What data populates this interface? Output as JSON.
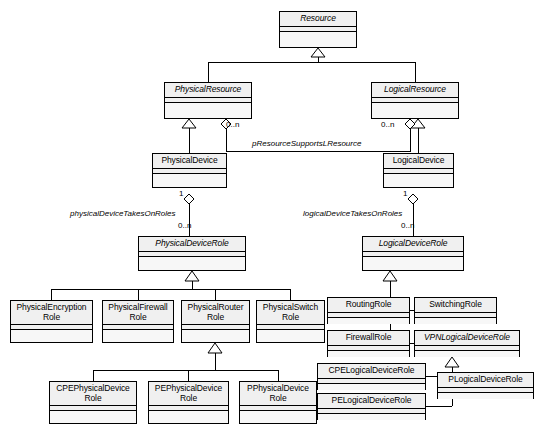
{
  "diagram": {
    "kind": "uml-class-diagram",
    "background": "#ffffff",
    "line_color": "#000000",
    "class_header_fill": "#f0f0f0",
    "class_body_fill": "#f7f7f7"
  },
  "classes": [
    {
      "id": "resource",
      "name": "Resource",
      "abstract": true,
      "x": 279,
      "y": 11,
      "w": 78,
      "h": 37
    },
    {
      "id": "physical_resource",
      "name": "PhysicalResource",
      "abstract": true,
      "x": 164,
      "y": 82,
      "w": 88,
      "h": 37
    },
    {
      "id": "logical_resource",
      "name": "LogicalResource",
      "abstract": true,
      "x": 371,
      "y": 82,
      "w": 88,
      "h": 37
    },
    {
      "id": "physical_device",
      "name": "PhysicalDevice",
      "abstract": false,
      "x": 152,
      "y": 153,
      "w": 75,
      "h": 35
    },
    {
      "id": "logical_device",
      "name": "LogicalDevice",
      "abstract": false,
      "x": 383,
      "y": 153,
      "w": 71,
      "h": 35
    },
    {
      "id": "physical_device_role",
      "name": "PhysicalDeviceRole",
      "abstract": true,
      "x": 138,
      "y": 236,
      "w": 108,
      "h": 35
    },
    {
      "id": "logical_device_role",
      "name": "LogicalDeviceRole",
      "abstract": true,
      "x": 362,
      "y": 236,
      "w": 102,
      "h": 35
    },
    {
      "id": "physical_encryption_role",
      "name": "PhysicalEncryption\nRole",
      "abstract": false,
      "x": 10,
      "y": 300,
      "w": 83,
      "h": 43
    },
    {
      "id": "physical_firewall_role",
      "name": "PhysicalFirewall\nRole",
      "abstract": false,
      "x": 102,
      "y": 300,
      "w": 72,
      "h": 43
    },
    {
      "id": "physical_router_role",
      "name": "PhysicalRouter\nRole",
      "abstract": false,
      "x": 181,
      "y": 300,
      "w": 69,
      "h": 43
    },
    {
      "id": "physical_switch_role",
      "name": "PhysicalSwitch\nRole",
      "abstract": false,
      "x": 256,
      "y": 300,
      "w": 69,
      "h": 43
    },
    {
      "id": "cpe_physical_device_role",
      "name": "CPEPhysicalDevice\nRole",
      "abstract": false,
      "x": 49,
      "y": 381,
      "w": 88,
      "h": 43
    },
    {
      "id": "pe_physical_device_role",
      "name": "PEPhysicalDevice\nRole",
      "abstract": false,
      "x": 148,
      "y": 381,
      "w": 81,
      "h": 43
    },
    {
      "id": "p_physical_device_role",
      "name": "PPhysicalDevice\nRole",
      "abstract": false,
      "x": 239,
      "y": 381,
      "w": 78,
      "h": 43
    },
    {
      "id": "routing_role",
      "name": "RoutingRole",
      "abstract": false,
      "x": 327,
      "y": 297,
      "w": 83,
      "h": 27
    },
    {
      "id": "switching_role",
      "name": "SwitchingRole",
      "abstract": false,
      "x": 414,
      "y": 297,
      "w": 83,
      "h": 27
    },
    {
      "id": "firewall_role",
      "name": "FirewallRole",
      "abstract": false,
      "x": 327,
      "y": 330,
      "w": 83,
      "h": 27
    },
    {
      "id": "vpn_logical_device_role",
      "name": "VPNLogicalDeviceRole",
      "abstract": true,
      "x": 414,
      "y": 330,
      "w": 106,
      "h": 27
    },
    {
      "id": "cpe_logical_device_role",
      "name": "CPELogicalDeviceRole",
      "abstract": false,
      "x": 317,
      "y": 363,
      "w": 109,
      "h": 27
    },
    {
      "id": "p_logical_device_role",
      "name": "PLogicalDeviceRole",
      "abstract": false,
      "x": 437,
      "y": 372,
      "w": 97,
      "h": 27
    },
    {
      "id": "pe_logical_device_role",
      "name": "PELogicalDeviceRole",
      "abstract": false,
      "x": 317,
      "y": 393,
      "w": 109,
      "h": 27
    }
  ],
  "associations": [
    {
      "id": "p_resource_supports_l_resource",
      "label": "pResourceSupportsLResource",
      "label_x": 252,
      "label_y": 139,
      "source": "physical_resource",
      "target": "logical_resource",
      "source_multiplicity": "0..n",
      "source_multiplicity_x": 226,
      "source_multiplicity_y": 120,
      "target_multiplicity": "0..n",
      "target_multiplicity_x": 381,
      "target_multiplicity_y": 120
    },
    {
      "id": "physical_device_takes_on_roles",
      "label": "physicalDeviceTakesOnRoles",
      "label_x": 70,
      "label_y": 209,
      "source": "physical_device",
      "target": "physical_device_role",
      "source_multiplicity": "1",
      "source_multiplicity_x": 179,
      "source_multiplicity_y": 189,
      "target_multiplicity": "0..n",
      "target_multiplicity_x": 178,
      "target_multiplicity_y": 221
    },
    {
      "id": "logical_device_takes_on_roles",
      "label": "logicalDeviceTakesOnRoles",
      "label_x": 303,
      "label_y": 209,
      "source": "logical_device",
      "target": "logical_device_role",
      "source_multiplicity": "1",
      "source_multiplicity_x": 405,
      "source_multiplicity_y": 189,
      "target_multiplicity": "0..n",
      "target_multiplicity_x": 403,
      "target_multiplicity_y": 221
    }
  ],
  "generalizations": [
    {
      "id": "gen-physicalresource-resource",
      "child": "physical_resource",
      "parent": "resource"
    },
    {
      "id": "gen-logicalresource-resource",
      "child": "logical_resource",
      "parent": "resource"
    },
    {
      "id": "gen-physicaldevice-presource",
      "child": "physical_device",
      "parent": "physical_resource"
    },
    {
      "id": "gen-logicaldevice-lresource",
      "child": "logical_device",
      "parent": "logical_resource"
    },
    {
      "id": "gen-pencrypt-pdrole",
      "child": "physical_encryption_role",
      "parent": "physical_device_role"
    },
    {
      "id": "gen-pfirewall-pdrole",
      "child": "physical_firewall_role",
      "parent": "physical_device_role"
    },
    {
      "id": "gen-prouter-pdrole",
      "child": "physical_router_role",
      "parent": "physical_device_role"
    },
    {
      "id": "gen-pswitch-pdrole",
      "child": "physical_switch_role",
      "parent": "physical_device_role"
    },
    {
      "id": "gen-cpepd-prouter",
      "child": "cpe_physical_device_role",
      "parent": "physical_router_role"
    },
    {
      "id": "gen-pepd-prouter",
      "child": "pe_physical_device_role",
      "parent": "physical_router_role"
    },
    {
      "id": "gen-ppd-prouter",
      "child": "p_physical_device_role",
      "parent": "physical_router_role"
    },
    {
      "id": "gen-routing-ldrole",
      "child": "routing_role",
      "parent": "logical_device_role"
    },
    {
      "id": "gen-switching-ldrole",
      "child": "switching_role",
      "parent": "logical_device_role"
    },
    {
      "id": "gen-firewall-ldrole",
      "child": "firewall_role",
      "parent": "logical_device_role"
    },
    {
      "id": "gen-vpnld-ldrole",
      "child": "vpn_logical_device_role",
      "parent": "logical_device_role"
    },
    {
      "id": "gen-cpeld-vpnld",
      "child": "cpe_logical_device_role",
      "parent": "vpn_logical_device_role"
    },
    {
      "id": "gen-peld-vpnld",
      "child": "pe_logical_device_role",
      "parent": "vpn_logical_device_role"
    },
    {
      "id": "gen-pld-vpnld",
      "child": "p_logical_device_role",
      "parent": "vpn_logical_device_role"
    }
  ],
  "edge_geometry": {
    "polylines": [
      {
        "name": "edge-resource-physicalresource",
        "points": "208,82 208,62 318,62 318,48"
      },
      {
        "name": "edge-resource-logicalresource",
        "points": "415,82 415,62 318,62 318,48"
      },
      {
        "name": "edge-physicalresource-physicaldevice",
        "points": "189,153 189,119"
      },
      {
        "name": "edge-logicalresource-logicaldevice",
        "points": "418,153 418,119"
      },
      {
        "name": "edge-presource-lresource-assoc",
        "points": "226,127 226,151 410,151 410,127"
      },
      {
        "name": "edge-physicaldevice-role",
        "points": "189,194 189,236"
      },
      {
        "name": "edge-logicaldevice-role",
        "points": "413,194 413,236"
      },
      {
        "name": "edge-pdrole-bus-stem",
        "points": "192,271 192,289"
      },
      {
        "name": "edge-pdrole-bus",
        "points": "51,289 290,289"
      },
      {
        "name": "edge-bus-pencrypt",
        "points": "51,289 51,300"
      },
      {
        "name": "edge-bus-pfirewall",
        "points": "138,289 138,300"
      },
      {
        "name": "edge-bus-prouter",
        "points": "215,289 215,300"
      },
      {
        "name": "edge-bus-pswitch",
        "points": "290,289 290,300"
      },
      {
        "name": "edge-prouter-bus-stem",
        "points": "215,343 215,370"
      },
      {
        "name": "edge-prouter-bus",
        "points": "93,370 278,370"
      },
      {
        "name": "edge-bus-cpepd",
        "points": "93,370 93,381"
      },
      {
        "name": "edge-bus-pepd",
        "points": "188,370 188,381"
      },
      {
        "name": "edge-bus-ppd",
        "points": "278,370 278,381"
      },
      {
        "name": "edge-ldrole-vbus",
        "points": "390,271 390,343"
      },
      {
        "name": "edge-vbus-routing",
        "points": "390,310 410,310"
      },
      {
        "name": "edge-vbus-switching",
        "points": "390,310 414,310"
      },
      {
        "name": "edge-vbus-firewall",
        "points": "390,343 410,343"
      },
      {
        "name": "edge-vbus-vpnld",
        "points": "390,343 414,343"
      },
      {
        "name": "edge-vpnld-vbus2",
        "points": "452,357 452,383"
      },
      {
        "name": "edge-vbus2-cpeld",
        "points": "426,376 452,376"
      },
      {
        "name": "edge-vbus2-pld",
        "points": "437,385 452,385"
      },
      {
        "name": "edge-vbus2-peld",
        "points": "426,406 452,406 452,383"
      }
    ]
  }
}
